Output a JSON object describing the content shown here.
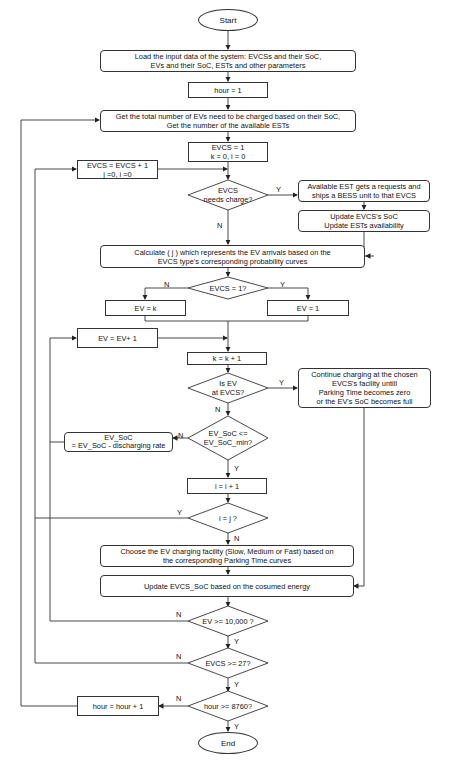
{
  "flowchart": {
    "start": "Start",
    "end": "End",
    "load_input": "Load the input data of the system: EVCSs and their SoC,\nEVs and their SoC, ESTs and other parameters",
    "hour_init": "hour = 1",
    "get_total": "Get the total number of EVs need to be charged based on their SoC,\nGet the number of the available ESTs",
    "evcs_init": "EVCS = 1\nk = 0, i = 0",
    "evcs_increment": "EVCS = EVCS + 1\nj =0, i =0",
    "decision_needs_charge": "EVCS\nneeds charge?",
    "est_request": "Available EST gets a requests and\nships a BESS unit to that EVCS",
    "update_soc_est": "Update EVCS's SoC\nUpdate ESTs availability",
    "calculate_j": "Calculate ( j ) which represents the EV arrivals based on the\nEVCS type's corresponding probability curves",
    "decision_evcs_1": "EVCS = 1?",
    "ev_k": "EV = k",
    "ev_1": "EV = 1",
    "ev_increment": "EV = EV+ 1",
    "k_increment": "k = k + 1",
    "decision_ev_at_evcs": "Is EV\nat EVCS?",
    "continue_charging": "Continue charging at the chosen\nEVCS's facility untill\nParking Time becomes zero\nor the EV's SoC becomes full",
    "decision_ev_soc": "EV_SoC <=\nEV_SoC_min?",
    "ev_soc_discharge": "EV_SoC\n= EV_SoC - discharging rate",
    "i_increment": "i = i + 1",
    "decision_i_j": "i = j ?",
    "choose_facility": "Choose the EV charging facility (Slow, Medium or Fast) based on\nthe corresponding Parking Time curves",
    "update_evcs_soc": "Update EVCS_SoC based on the cosumed energy",
    "decision_ev_10000": "EV >= 10,000 ?",
    "decision_evcs_27": "EVCS >= 27?",
    "decision_hour_8760": "hour >= 8760?",
    "hour_increment": "hour = hour + 1"
  },
  "labels": {
    "yes": "Y",
    "no": "N"
  },
  "colors": {
    "line": "#333333",
    "background": "#ffffff"
  }
}
